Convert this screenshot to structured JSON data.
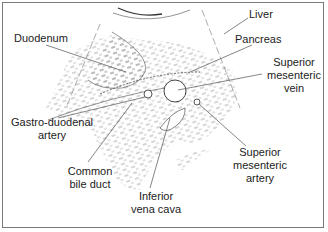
{
  "diagram": {
    "type": "anatomical-cross-section",
    "labels": [
      {
        "id": "liver",
        "text": "Liver",
        "x": 249,
        "y": 8
      },
      {
        "id": "duodenum",
        "text": "Duodenum",
        "x": 14,
        "y": 32
      },
      {
        "id": "pancreas",
        "text": "Pancreas",
        "x": 235,
        "y": 33
      },
      {
        "id": "superior-mesenteric-vein",
        "text": "Superior\nmesenteric\nvein",
        "x": 262,
        "y": 56
      },
      {
        "id": "gastro-duodenal-artery",
        "text": "Gastro-duodenal\nartery",
        "x": 4,
        "y": 116
      },
      {
        "id": "superior-mesenteric-artery",
        "text": "Superior\nmesenteric\nartery",
        "x": 228,
        "y": 146
      },
      {
        "id": "common-bile-duct",
        "text": "Common\nbile duct",
        "x": 62,
        "y": 165
      },
      {
        "id": "inferior-vena-cava",
        "text": "Inferior\nvena cava",
        "x": 126,
        "y": 190
      }
    ],
    "colors": {
      "line": "#555555",
      "stipple": "#888888",
      "text": "#222222",
      "border": "#7a7a7a"
    }
  }
}
